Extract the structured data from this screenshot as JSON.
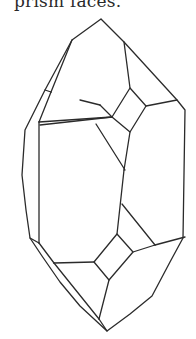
{
  "caption": {
    "text": "prism faces."
  },
  "figure": {
    "line_color": "#2b2b2b",
    "background": "#ffffff"
  }
}
